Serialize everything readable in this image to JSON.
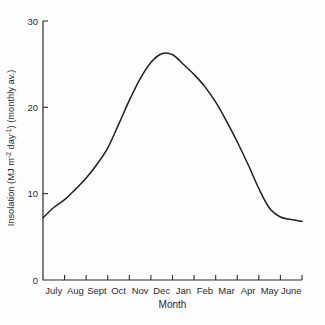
{
  "chart_data": {
    "type": "line",
    "title": "",
    "xlabel": "Month",
    "ylabel": "Insolation (MJ m-2 day-1) (monthly av.)",
    "ylabel_segments": [
      {
        "t": "Insolation (MJ m"
      },
      {
        "t": "-2",
        "sup": true
      },
      {
        "t": " day"
      },
      {
        "t": "-1",
        "sup": true
      },
      {
        "t": ") (monthly av.)"
      }
    ],
    "categories": [
      "July",
      "Aug",
      "Sept",
      "Oct",
      "Nov",
      "Dec",
      "Jan",
      "Feb",
      "Mar",
      "Apr",
      "May",
      "June"
    ],
    "values": [
      8.4,
      10.5,
      13.4,
      18.0,
      23.3,
      26.2,
      25.0,
      22.4,
      18.4,
      13.4,
      8.3,
      7.0
    ],
    "curve_points": [
      [
        0,
        7.2
      ],
      [
        0.5,
        8.4
      ],
      [
        1,
        9.3
      ],
      [
        1.5,
        10.5
      ],
      [
        2,
        11.8
      ],
      [
        2.5,
        13.4
      ],
      [
        3,
        15.3
      ],
      [
        3.5,
        18.0
      ],
      [
        4,
        20.8
      ],
      [
        4.5,
        23.3
      ],
      [
        5,
        25.2
      ],
      [
        5.5,
        26.2
      ],
      [
        6,
        26.1
      ],
      [
        6.5,
        25.0
      ],
      [
        7,
        23.8
      ],
      [
        7.5,
        22.4
      ],
      [
        8,
        20.6
      ],
      [
        8.5,
        18.4
      ],
      [
        9,
        16.0
      ],
      [
        9.5,
        13.4
      ],
      [
        10,
        10.6
      ],
      [
        10.5,
        8.3
      ],
      [
        11,
        7.3
      ],
      [
        11.5,
        7.0
      ],
      [
        12,
        6.8
      ]
    ],
    "xlim_months": [
      0,
      12
    ],
    "ylim": [
      0,
      30
    ],
    "yticks": [
      0,
      10,
      20,
      30
    ],
    "grid": false,
    "legend": null,
    "line_color": "#1f1f1f",
    "axis_color": "#2b2b2b",
    "background": "#fdfdfd"
  }
}
